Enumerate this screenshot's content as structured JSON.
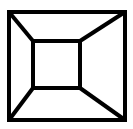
{
  "figure": {
    "stroke_color": "#000000",
    "background": "#ffffff",
    "stroke_width": 4,
    "outer_square": {
      "x1": 9,
      "y1": 12,
      "x2": 125,
      "y2": 120
    },
    "inner_square": {
      "x1": 33,
      "y1": 41,
      "x2": 80,
      "y2": 88
    }
  }
}
